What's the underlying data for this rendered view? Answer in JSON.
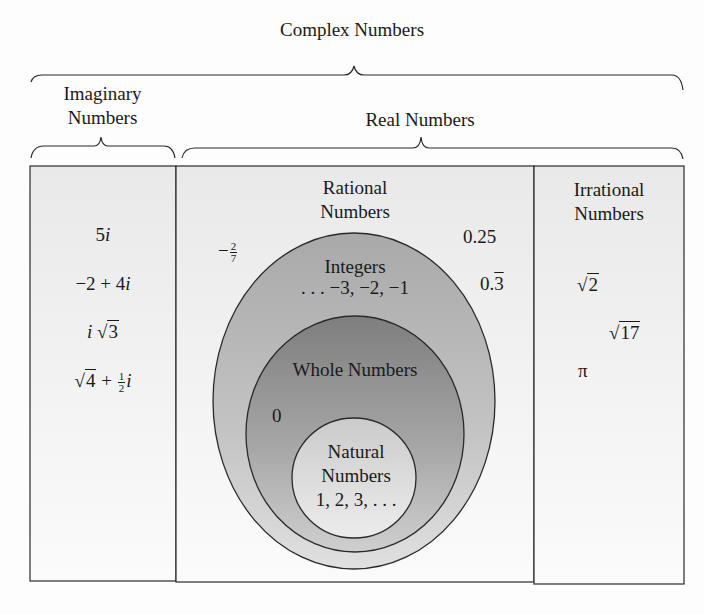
{
  "title": "Complex Numbers",
  "groups": {
    "imaginary": {
      "label_line1": "Imaginary",
      "label_line2": "Numbers"
    },
    "real": {
      "label": "Real Numbers"
    }
  },
  "columns": {
    "imaginary": {
      "examples": [
        {
          "id": "ex1",
          "text": "5i"
        },
        {
          "id": "ex2",
          "text": "−2 + 4i"
        },
        {
          "id": "ex3",
          "text": "i√3"
        },
        {
          "id": "ex4",
          "text": "√4 + ½i"
        }
      ],
      "ex1": {
        "num": "5",
        "unit": "i"
      },
      "ex2": {
        "a": "−2 + 4",
        "unit": "i"
      },
      "ex3": {
        "unit": "i",
        "radical": "√",
        "radicand": "3"
      },
      "ex4": {
        "radical": "√",
        "radicand": "4",
        "plus": " + ",
        "num": "1",
        "den": "2",
        "unit": "i"
      }
    },
    "rational": {
      "label_line1": "Rational",
      "label_line2": "Numbers",
      "examples": {
        "neg_frac": {
          "sign": "−",
          "num": "2",
          "den": "7"
        },
        "quarter": "0.25",
        "repeating": {
          "whole": "0.",
          "repeat": "3"
        }
      }
    },
    "irrational": {
      "label_line1": "Irrational",
      "label_line2": "Numbers",
      "examples": {
        "sqrt2": {
          "radical": "√",
          "radicand": "2"
        },
        "sqrt17": {
          "radical": "√",
          "radicand": "17"
        },
        "pi": "π"
      }
    }
  },
  "sets": {
    "integers": {
      "label": "Integers",
      "examples": ". . . −3, −2, −1"
    },
    "whole": {
      "label": "Whole Numbers",
      "examples": "0"
    },
    "natural": {
      "label_line1": "Natural",
      "label_line2": "Numbers",
      "examples": "1, 2, 3, . . ."
    }
  },
  "colors": {
    "line": "#2a2a2a",
    "box_fill": "#f0f0f0",
    "integers_fill": "#b9b9b9",
    "whole_fill": "#9a9a9a",
    "natural_fill": "#dcdcdc"
  }
}
